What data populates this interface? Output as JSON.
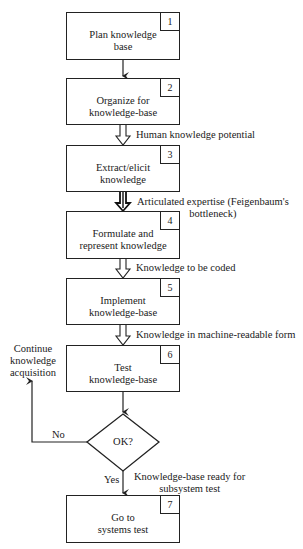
{
  "diagram": {
    "steps": [
      {
        "num": "1",
        "text": "Plan knowledge\nbase"
      },
      {
        "num": "2",
        "text": "Organize for\nknowledge-base"
      },
      {
        "num": "3",
        "text": "Extract/elicit\nknowledge"
      },
      {
        "num": "4",
        "text": "Formulate and\nrepresent knowledge"
      },
      {
        "num": "5",
        "text": "Implement\nknowledge-base"
      },
      {
        "num": "6",
        "text": "Test\nknowledge-base"
      },
      {
        "num": "7",
        "text": "Go to\nsystems test"
      }
    ],
    "flows": [
      "Human knowledge potential",
      "Articulated expertise (Feigenbaum's\nbottleneck)",
      "Knowledge to be coded",
      "Knowledge in machine-readable form",
      "Knowledge-base ready for\nsubsystem test"
    ],
    "decision": {
      "text": "OK?",
      "yes_label": "Yes",
      "no_label": "No"
    },
    "loop_label": "Continue\nknowledge\nacquisition"
  }
}
